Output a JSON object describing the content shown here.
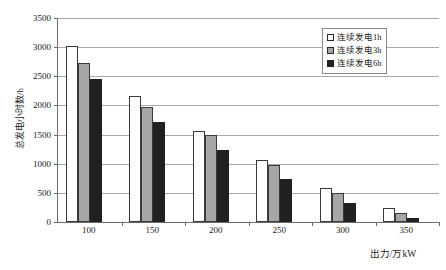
{
  "chart_data": {
    "type": "bar",
    "title": "",
    "xlabel": "出力/万kW",
    "ylabel": "总发电小时数/h",
    "categories": [
      "100",
      "150",
      "200",
      "250",
      "300",
      "350"
    ],
    "series": [
      {
        "name": "连续发电1h",
        "color": "#ffffff",
        "values": [
          3020,
          2170,
          1570,
          1060,
          580,
          240
        ]
      },
      {
        "name": "连续发电3h",
        "color": "#a6a6a6",
        "values": [
          2730,
          1970,
          1500,
          970,
          500,
          160
        ]
      },
      {
        "name": "连续发电6h",
        "color": "#231f20",
        "values": [
          2450,
          1710,
          1230,
          740,
          330,
          70
        ]
      }
    ],
    "ylim": [
      0,
      3500
    ],
    "ytick_labels": [
      "0",
      "500",
      "1000",
      "1500",
      "2000",
      "2500",
      "3000",
      "3500"
    ],
    "ytick_values": [
      0,
      500,
      1000,
      1500,
      2000,
      2500,
      3000,
      3500
    ],
    "grid": true,
    "legend_position": "top-right"
  },
  "legend": {
    "items": [
      {
        "label": "连续发电1h"
      },
      {
        "label": "连续发电3h"
      },
      {
        "label": "连续发电6h"
      }
    ]
  },
  "axes": {
    "x_title": "出力/万kW",
    "y_title": "总发电小时数/h"
  }
}
